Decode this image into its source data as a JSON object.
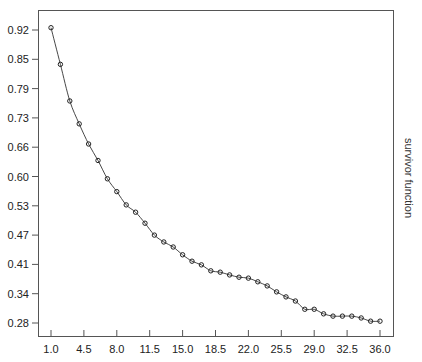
{
  "chart_data": {
    "type": "line",
    "title": "",
    "xlabel": "",
    "ylabel": "survivor function",
    "ylabel_side": "right",
    "grid": false,
    "legend": null,
    "xlim": [
      1.0,
      36.0
    ],
    "ylim": [
      0.28,
      0.92
    ],
    "x_ticks": [
      "1.0",
      "4.5",
      "8.0",
      "11.5",
      "15.0",
      "18.5",
      "22.0",
      "25.5",
      "29.0",
      "32.5",
      "36.0"
    ],
    "y_ticks": [
      "0.92",
      "0.85",
      "0.79",
      "0.73",
      "0.66",
      "0.60",
      "0.53",
      "0.47",
      "0.41",
      "0.34",
      "0.28"
    ],
    "series": [
      {
        "name": "survivor function",
        "markers": "open-circle",
        "line": "smooth",
        "x": [
          1,
          2,
          3,
          4,
          5,
          6,
          7,
          8,
          9,
          10,
          11,
          12,
          13,
          14,
          15,
          16,
          17,
          18,
          19,
          20,
          21,
          22,
          23,
          24,
          25,
          26,
          27,
          28,
          29,
          30,
          31,
          32,
          33,
          34,
          35,
          36
        ],
        "values": [
          0.925,
          0.845,
          0.765,
          0.715,
          0.671,
          0.635,
          0.595,
          0.567,
          0.538,
          0.522,
          0.498,
          0.472,
          0.457,
          0.446,
          0.429,
          0.415,
          0.407,
          0.394,
          0.391,
          0.385,
          0.38,
          0.378,
          0.37,
          0.361,
          0.348,
          0.337,
          0.328,
          0.31,
          0.31,
          0.3,
          0.295,
          0.295,
          0.295,
          0.291,
          0.284,
          0.284
        ]
      }
    ]
  }
}
